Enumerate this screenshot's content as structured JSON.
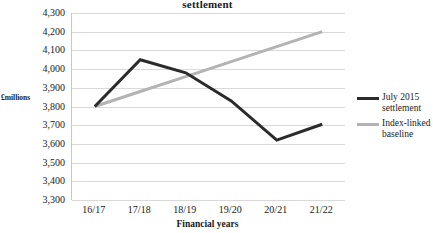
{
  "chart_data": {
    "type": "line",
    "title": "settlement",
    "xlabel": "Financial years",
    "ylabel": "£millions",
    "categories": [
      "16/17",
      "17/18",
      "18/19",
      "19/20",
      "20/21",
      "21/22"
    ],
    "ylim": [
      3300,
      4300
    ],
    "ytick_step": 100,
    "yticks": [
      "4,300",
      "4,200",
      "4,100",
      "4,000",
      "3,900",
      "3,800",
      "3,700",
      "3,600",
      "3,500",
      "3,400",
      "3,300"
    ],
    "ytick_values": [
      4300,
      4200,
      4100,
      4000,
      3900,
      3800,
      3700,
      3600,
      3500,
      3400,
      3300
    ],
    "grid": true,
    "legend_position": "right",
    "series": [
      {
        "name": "July 2015 settlement",
        "color": "#2b2b2b",
        "values": [
          3800,
          4050,
          3980,
          3830,
          3620,
          3705
        ]
      },
      {
        "name": "Index-linked baseline",
        "color": "#b3b3b3",
        "values": [
          3800,
          3880,
          3960,
          4040,
          4120,
          4200
        ]
      }
    ]
  },
  "legend": {
    "items": [
      {
        "label": "July 2015 settlement",
        "swatch_color": "#2b2b2b"
      },
      {
        "label": "Index-linked baseline",
        "swatch_color": "#b3b3b3"
      }
    ]
  }
}
